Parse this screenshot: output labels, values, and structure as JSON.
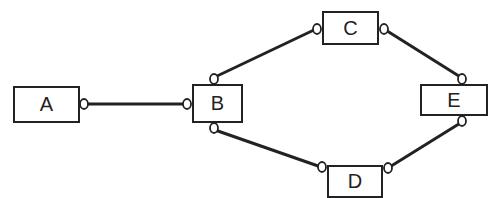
{
  "diagram": {
    "nodes": [
      {
        "id": "A",
        "label": "A",
        "x": 13,
        "y": 86,
        "w": 67,
        "h": 37
      },
      {
        "id": "B",
        "label": "B",
        "x": 192,
        "y": 84,
        "w": 51,
        "h": 39
      },
      {
        "id": "C",
        "label": "C",
        "x": 322,
        "y": 11,
        "w": 57,
        "h": 34
      },
      {
        "id": "D",
        "label": "D",
        "x": 327,
        "y": 165,
        "w": 56,
        "h": 33
      },
      {
        "id": "E",
        "label": "E",
        "x": 420,
        "y": 84,
        "w": 68,
        "h": 32
      }
    ],
    "edges": [
      {
        "from": "A",
        "to": "B"
      },
      {
        "from": "B",
        "to": "C"
      },
      {
        "from": "B",
        "to": "D"
      },
      {
        "from": "C",
        "to": "E"
      },
      {
        "from": "D",
        "to": "E"
      }
    ],
    "colors": {
      "line": "#222222",
      "background": "#ffffff"
    }
  }
}
